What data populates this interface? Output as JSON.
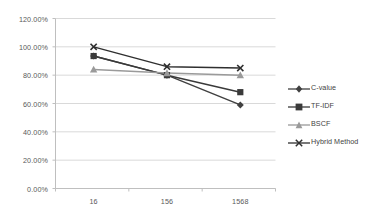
{
  "chart_data": {
    "type": "line",
    "title": "",
    "subtitle": "",
    "xlabel": "",
    "ylabel": "",
    "categories": [
      "16",
      "156",
      "1568"
    ],
    "x_tick_labels": [
      "16",
      "156",
      "1568"
    ],
    "y_tick_labels": [
      "0.00%",
      "20.00%",
      "40.00%",
      "60.00%",
      "80.00%",
      "100.00%",
      "120.00%"
    ],
    "y_tick_values": [
      0,
      20,
      40,
      60,
      80,
      100,
      120
    ],
    "ylim": [
      0,
      120
    ],
    "grid": "horizontal",
    "legend_position": "right",
    "series": [
      {
        "name": "C-value",
        "marker": "diamond",
        "color": "#404040",
        "values": [
          93.5,
          80.0,
          59.0
        ]
      },
      {
        "name": "TF-IDF",
        "marker": "square",
        "color": "#3a3a3a",
        "values": [
          93.5,
          80.0,
          68.0
        ]
      },
      {
        "name": "BSCF",
        "marker": "triangle",
        "color": "#9a9a9a",
        "values": [
          84.0,
          81.5,
          80.0
        ]
      },
      {
        "name": "Hybrid Method",
        "marker": "x",
        "color": "#2f2f2f",
        "values": [
          100.0,
          86.0,
          85.0
        ]
      }
    ]
  },
  "legend": {
    "items": [
      {
        "label": "C-value"
      },
      {
        "label": "TF-IDF"
      },
      {
        "label": "BSCF"
      },
      {
        "label": "Hybrid Method"
      }
    ]
  },
  "colors": {
    "grid": "#d9d9d9",
    "axis": "#bfbfbf",
    "tick_text": "#595959",
    "legend_text": "#3f3f3f",
    "background": "#ffffff"
  }
}
